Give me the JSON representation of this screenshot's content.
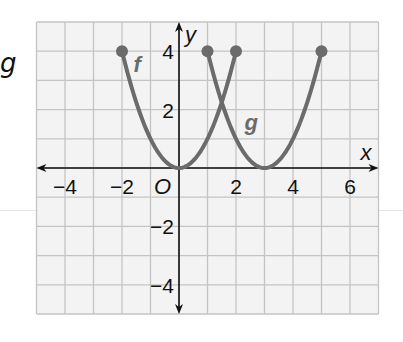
{
  "side_label": "g",
  "chart_data": {
    "type": "line",
    "title": "",
    "xlabel": "x",
    "ylabel": "y",
    "origin_label": "O",
    "xlim": [
      -5,
      7
    ],
    "ylim": [
      -5,
      5
    ],
    "grid": true,
    "x_ticks": [
      -4,
      -2,
      2,
      4,
      6
    ],
    "x_tick_labels": [
      "−4",
      "−2",
      "2",
      "4",
      "6"
    ],
    "y_ticks": [
      4,
      2,
      -2,
      -4
    ],
    "y_tick_labels": [
      "4",
      "2",
      "−2",
      "−4"
    ],
    "series": [
      {
        "name": "f",
        "equation": "f(x) = x^2",
        "domain": [
          -2,
          2
        ],
        "points": [
          [
            -2,
            4
          ],
          [
            -1,
            1
          ],
          [
            0,
            0
          ],
          [
            1,
            1
          ],
          [
            2,
            4
          ]
        ],
        "endpoints": [
          [
            -2,
            4
          ],
          [
            2,
            4
          ]
        ],
        "label_pos": [
          -1.6,
          3.3
        ],
        "color": "#6b6b6b"
      },
      {
        "name": "g",
        "equation": "g(x) = (x - 3)^2",
        "domain": [
          1,
          5
        ],
        "points": [
          [
            1,
            4
          ],
          [
            2,
            1
          ],
          [
            3,
            0
          ],
          [
            4,
            1
          ],
          [
            5,
            4
          ]
        ],
        "endpoints": [
          [
            1,
            4
          ],
          [
            5,
            4
          ]
        ],
        "label_pos": [
          2.3,
          1.3
        ],
        "color": "#6b6b6b"
      }
    ],
    "colors": {
      "grid": "#c4c4c4",
      "grid_bg": "#f3f3f3",
      "axis": "#111111",
      "curve": "#6b6b6b"
    }
  }
}
